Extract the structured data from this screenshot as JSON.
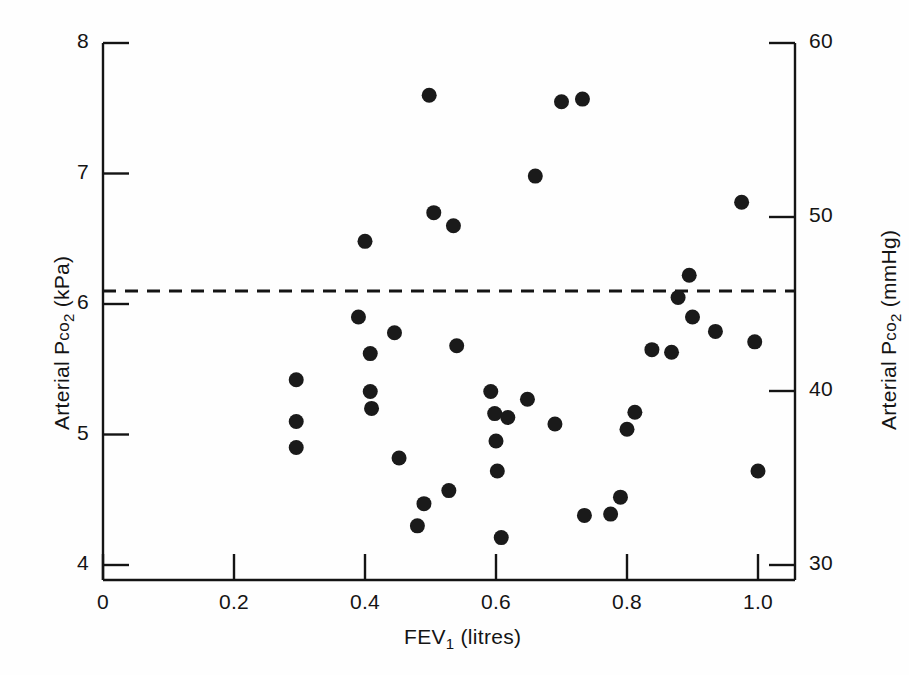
{
  "chart_data": {
    "type": "scatter",
    "title": "",
    "xlabel": "FEV1 (litres)",
    "ylabel": "Arterial PCO2 (kPa)",
    "y2label": "Arterial PCO2 (mmHg)",
    "xlim": [
      0,
      1.08
    ],
    "ylim": [
      4,
      8
    ],
    "y2lim": [
      30,
      60
    ],
    "grid": false,
    "legend": null,
    "xticks": [
      "0",
      "0.2",
      "0.4",
      "0.6",
      "0.8",
      "1.0"
    ],
    "xtick_values": [
      0,
      0.2,
      0.4,
      0.6,
      0.8,
      1.0
    ],
    "yticks": [
      "4",
      "5",
      "6",
      "7",
      "8"
    ],
    "ytick_values": [
      4,
      5,
      6,
      7,
      8
    ],
    "y2ticks": [
      "30",
      "40",
      "50",
      "60"
    ],
    "y2tick_values": [
      30,
      40,
      50,
      60
    ],
    "reference_line": {
      "orientation": "horizontal",
      "value": 6.1,
      "style": "dashed",
      "color": "#141414"
    },
    "marker": {
      "shape": "circle",
      "color": "#1a1a1a",
      "size_px": 15
    },
    "points": [
      {
        "x": 0.295,
        "y": 5.42
      },
      {
        "x": 0.295,
        "y": 5.1
      },
      {
        "x": 0.295,
        "y": 4.9
      },
      {
        "x": 0.39,
        "y": 5.9
      },
      {
        "x": 0.4,
        "y": 6.48
      },
      {
        "x": 0.408,
        "y": 5.62
      },
      {
        "x": 0.408,
        "y": 5.33
      },
      {
        "x": 0.41,
        "y": 5.2
      },
      {
        "x": 0.445,
        "y": 5.78
      },
      {
        "x": 0.452,
        "y": 4.82
      },
      {
        "x": 0.48,
        "y": 4.3
      },
      {
        "x": 0.49,
        "y": 4.47
      },
      {
        "x": 0.498,
        "y": 7.6
      },
      {
        "x": 0.505,
        "y": 6.7
      },
      {
        "x": 0.528,
        "y": 4.57
      },
      {
        "x": 0.535,
        "y": 6.6
      },
      {
        "x": 0.54,
        "y": 5.68
      },
      {
        "x": 0.592,
        "y": 5.33
      },
      {
        "x": 0.598,
        "y": 5.16
      },
      {
        "x": 0.6,
        "y": 4.95
      },
      {
        "x": 0.602,
        "y": 4.72
      },
      {
        "x": 0.608,
        "y": 4.21
      },
      {
        "x": 0.618,
        "y": 5.13
      },
      {
        "x": 0.648,
        "y": 5.27
      },
      {
        "x": 0.66,
        "y": 6.98
      },
      {
        "x": 0.69,
        "y": 5.08
      },
      {
        "x": 0.7,
        "y": 7.55
      },
      {
        "x": 0.732,
        "y": 7.57
      },
      {
        "x": 0.735,
        "y": 4.38
      },
      {
        "x": 0.775,
        "y": 4.39
      },
      {
        "x": 0.79,
        "y": 4.52
      },
      {
        "x": 0.8,
        "y": 5.04
      },
      {
        "x": 0.812,
        "y": 5.17
      },
      {
        "x": 0.838,
        "y": 5.65
      },
      {
        "x": 0.868,
        "y": 5.63
      },
      {
        "x": 0.878,
        "y": 6.05
      },
      {
        "x": 0.895,
        "y": 6.22
      },
      {
        "x": 0.9,
        "y": 5.9
      },
      {
        "x": 0.935,
        "y": 5.79
      },
      {
        "x": 0.975,
        "y": 6.78
      },
      {
        "x": 0.995,
        "y": 5.71
      },
      {
        "x": 1.0,
        "y": 4.72
      }
    ]
  },
  "axes": {
    "x_title_main": "FEV",
    "x_title_sub": "1",
    "x_title_tail": " (litres)",
    "y_left_prefix": "Arterial P",
    "y_left_co": "co",
    "y_left_sub": "2",
    "y_left_unit": " (kPa)",
    "y_right_prefix": "Arterial P",
    "y_right_co": "co",
    "y_right_sub": "2",
    "y_right_unit": " (mmHg)"
  },
  "colors": {
    "ink": "#141414",
    "marker": "#1a1a1a",
    "background": "#fefefe"
  }
}
